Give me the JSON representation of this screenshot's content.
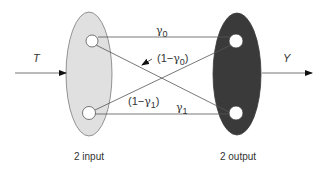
{
  "diagram": {
    "type": "binary-channel",
    "input": {
      "signal_label": "T",
      "set_label": "2 input",
      "fill_color": "#e0e0e0",
      "nodes": 2
    },
    "output": {
      "signal_label": "Y",
      "set_label": "2 output",
      "fill_color": "#3a3a3a",
      "nodes": 2
    },
    "transitions": [
      {
        "from": "input-0",
        "to": "output-0",
        "label": "γ0",
        "sym": "γ",
        "sub": "0",
        "prefix": "",
        "suffix": ""
      },
      {
        "from": "input-0",
        "to": "output-1",
        "label": "(1−γ0)",
        "sym": "γ",
        "sub": "0",
        "prefix": "(1−",
        "suffix": ")"
      },
      {
        "from": "input-1",
        "to": "output-0",
        "label": "(1−γ1)",
        "sym": "γ",
        "sub": "1",
        "prefix": "(1−",
        "suffix": ")"
      },
      {
        "from": "input-1",
        "to": "output-1",
        "label": "γ1",
        "sym": "γ",
        "sub": "1",
        "prefix": "",
        "suffix": ""
      }
    ],
    "line_color": "#555555"
  }
}
